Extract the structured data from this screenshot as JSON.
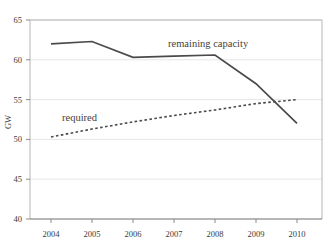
{
  "chart_data": {
    "type": "line",
    "title": "",
    "xlabel": "",
    "ylabel": "GW",
    "x": [
      2004,
      2005,
      2006,
      2007,
      2008,
      2009,
      2010
    ],
    "categories": [
      "2004",
      "2005",
      "2006",
      "2007",
      "2008",
      "2009",
      "2010"
    ],
    "ylim": [
      40,
      65
    ],
    "yticks": [
      40,
      45,
      50,
      55,
      60,
      65
    ],
    "ytick_labels": [
      "40",
      "45",
      "50",
      "55",
      "60",
      "65"
    ],
    "grid": true,
    "legend_position": "inline-annotation",
    "series": [
      {
        "name": "remaining capacity",
        "style": "solid",
        "color": "#4a4a4a",
        "values": [
          62.0,
          62.3,
          60.3,
          60.45,
          60.6,
          57.0,
          52.0
        ]
      },
      {
        "name": "required",
        "style": "dotted",
        "color": "#4a4a4a",
        "values": [
          50.3,
          51.3,
          52.2,
          53.0,
          53.7,
          54.5,
          55.0
        ]
      }
    ],
    "annotations": [
      {
        "text": "remaining capacity",
        "x": 2007.35,
        "y": 62.6
      },
      {
        "text": "required",
        "x": 2004.45,
        "y": 52.9
      }
    ]
  },
  "axes": {
    "y_axis_title": "GW",
    "y_tick_0": "40",
    "y_tick_1": "45",
    "y_tick_2": "50",
    "y_tick_3": "55",
    "y_tick_4": "60",
    "y_tick_5": "65",
    "x_tick_0": "2004",
    "x_tick_1": "2005",
    "x_tick_2": "2006",
    "x_tick_3": "2007",
    "x_tick_4": "2008",
    "x_tick_5": "2009",
    "x_tick_6": "2010"
  },
  "annotations": {
    "remaining_capacity_label": "remaining capacity",
    "required_label": "required"
  },
  "colors": {
    "line": "#4a4a4a",
    "grid": "#e6e6e6",
    "frame": "#b5b5b5",
    "text": "#3a3a3a"
  }
}
